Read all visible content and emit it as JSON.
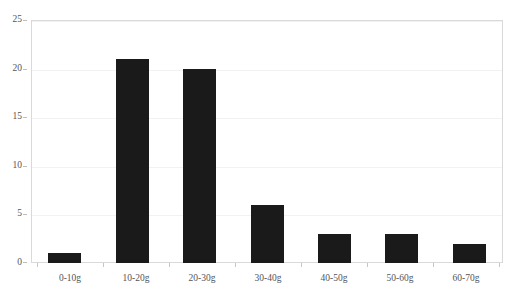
{
  "chart_data": {
    "type": "bar",
    "title": "",
    "subtitle": "",
    "xlabel": "",
    "ylabel": "",
    "categories": [
      "0-10g",
      "10-20g",
      "20-30g",
      "30-40g",
      "40-50g",
      "50-60g",
      "60-70g"
    ],
    "values": [
      1,
      21,
      20,
      6,
      3,
      3,
      2
    ],
    "ylim": [
      0,
      25
    ],
    "yticks": [
      0,
      5,
      10,
      15,
      20,
      25
    ],
    "ytick_labels": [
      "0",
      "5",
      "10",
      "15",
      "20",
      "25"
    ],
    "grid": true,
    "legend": null,
    "legend_position": "none",
    "bar_color": "#1a1a1a",
    "gridline_color": "#f2f2f2",
    "axis_color": "#d9d9d9",
    "tick_label_color": "#555555",
    "background_color": "#ffffff",
    "annotations": []
  }
}
